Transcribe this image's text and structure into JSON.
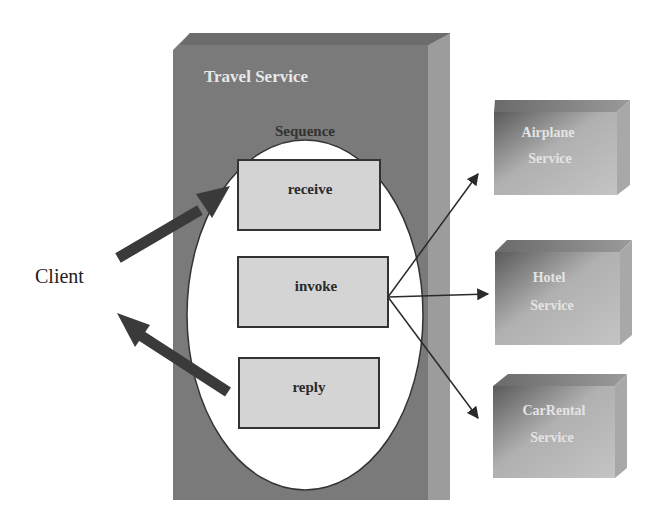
{
  "diagram": {
    "client": {
      "label": "Client"
    },
    "travel_service": {
      "title": "Travel Service",
      "sequence": {
        "label": "Sequence",
        "activities": [
          {
            "label": "receive"
          },
          {
            "label": "invoke"
          },
          {
            "label": "reply"
          }
        ]
      }
    },
    "services": [
      {
        "line1": "Airplane",
        "line2": "Service"
      },
      {
        "line1": "Hotel",
        "line2": "Service"
      },
      {
        "line1": "CarRental",
        "line2": "Service"
      }
    ],
    "colors": {
      "outer_box": "#7a7a7a",
      "outer_box_side": "#9a9a9a",
      "activity_fill": "#d4d4d4",
      "arrow": "#3a3a3a",
      "service_fill": "#b8b8b8"
    }
  }
}
